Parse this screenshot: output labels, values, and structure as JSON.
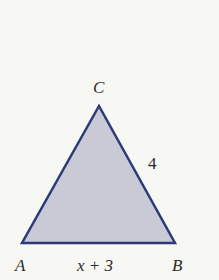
{
  "diagram": {
    "type": "triangle",
    "vertices": {
      "A": {
        "label": "A"
      },
      "B": {
        "label": "B"
      },
      "C": {
        "label": "C"
      }
    },
    "sides": {
      "AB": {
        "label": "x + 3"
      },
      "BC": {
        "label": "4"
      }
    },
    "colors": {
      "fill": "#c9cad6",
      "stroke": "#2b3a78",
      "background": "#f7f7f4",
      "text": "#2a2a2a"
    }
  }
}
